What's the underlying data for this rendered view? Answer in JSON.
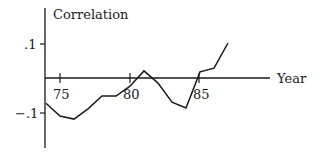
{
  "chart_data": {
    "type": "line",
    "title": "",
    "xlabel": "Year",
    "ylabel": "Correlation",
    "x_ticks": [
      75,
      80,
      85
    ],
    "x_tick_labels": [
      "75",
      "80",
      "85"
    ],
    "y_ticks": [
      0.1,
      -0.1
    ],
    "y_tick_labels": [
      ".1",
      "−.1"
    ],
    "xlim": [
      74,
      90
    ],
    "ylim": [
      -0.21,
      0.2
    ],
    "grid": false,
    "legend": null,
    "x": [
      74,
      75,
      76,
      77,
      78,
      79,
      80,
      81,
      82,
      83,
      84,
      85,
      86,
      87
    ],
    "series": [
      {
        "name": "Correlation",
        "color": "#1a1a1a",
        "values": [
          -0.074,
          -0.112,
          -0.121,
          -0.091,
          -0.053,
          -0.053,
          -0.024,
          0.021,
          -0.015,
          -0.071,
          -0.088,
          0.018,
          0.029,
          0.103
        ]
      }
    ]
  },
  "labels": {
    "ylabel": "Correlation",
    "xlabel": "Year",
    "ytick_pos": ".1",
    "ytick_neg": "−.1",
    "xtick_75": "75",
    "xtick_80": "80",
    "xtick_85": "85"
  }
}
